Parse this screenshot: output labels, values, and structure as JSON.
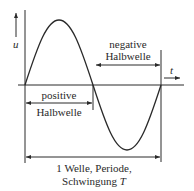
{
  "diagram": {
    "type": "sine-wave-annotation",
    "axes": {
      "y_label": "u",
      "x_label": "t"
    },
    "labels": {
      "negative_line1": "negative",
      "negative_line2": "Halbwelle",
      "positive_line1": "positive",
      "positive_line2": "Halbwelle",
      "period_line1": "1 Welle, Periode,",
      "period_line2_prefix": "Schwingung ",
      "period_line2_symbol": "T"
    },
    "colors": {
      "stroke": "#2a2a2a",
      "background": "#ffffff"
    }
  }
}
